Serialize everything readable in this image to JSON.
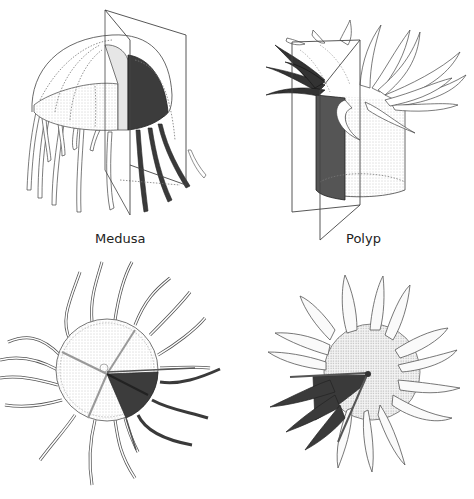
{
  "figure": {
    "panels": [
      {
        "id": "medusa-side",
        "label": "Medusa",
        "view": "side"
      },
      {
        "id": "polyp-side",
        "label": "Polyp",
        "view": "side"
      },
      {
        "id": "medusa-top",
        "label": "",
        "view": "top"
      },
      {
        "id": "polyp-top",
        "label": "",
        "view": "top"
      }
    ]
  },
  "colors": {
    "line": "#333333",
    "dark_segment": "#3c3c3c",
    "light_fill": "#f2f2f2",
    "stipple": "#d9d9d9",
    "background": "#ffffff"
  }
}
